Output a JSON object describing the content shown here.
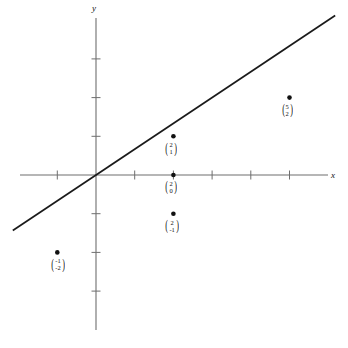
{
  "figure": {
    "axes": {
      "x_label": "x",
      "y_label": "y",
      "origin_px": [
        96,
        175
      ],
      "unit_px": 38.7
    }
  },
  "chart_data": {
    "type": "scatter",
    "title": "",
    "xlabel": "x",
    "ylabel": "y",
    "grid": false,
    "legend": null,
    "xlim": [
      -2.5,
      6.5
    ],
    "ylim": [
      -4.5,
      4.5
    ],
    "x_ticks": [
      -1,
      1,
      2,
      3,
      4,
      5
    ],
    "y_ticks": [
      -3,
      -2,
      -1,
      1,
      2,
      3
    ],
    "tick_labels_shown": false,
    "line": {
      "description": "straight line through the origin",
      "slope": 0.6667,
      "intercept": 0,
      "x_start": -2.15,
      "x_end": 6.18,
      "color": "#1a1a1a"
    },
    "points": [
      {
        "x": -1,
        "y": -2,
        "label_top": "-1",
        "label_bottom": "-2",
        "on_line": true,
        "label_pos": "below-right"
      },
      {
        "x": 2,
        "y": 1,
        "label_top": "2",
        "label_bottom": "1",
        "on_line": false,
        "label_pos": "below"
      },
      {
        "x": 2,
        "y": 0,
        "label_top": "2",
        "label_bottom": "0",
        "on_line": true,
        "label_pos": "below"
      },
      {
        "x": 2,
        "y": -1,
        "label_top": "2",
        "label_bottom": "-1",
        "on_line": false,
        "label_pos": "below"
      },
      {
        "x": 5,
        "y": 2,
        "label_top": "5",
        "label_bottom": "2",
        "on_line": true,
        "label_pos": "below"
      }
    ],
    "colors": {
      "axis": "#6e6e6e",
      "line": "#1a1a1a",
      "point": "#111111",
      "background": "#ffffff"
    }
  }
}
